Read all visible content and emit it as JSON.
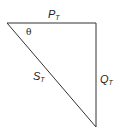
{
  "diagram": {
    "sides": {
      "top": {
        "label": "P",
        "subscript": "T"
      },
      "right": {
        "label": "Q",
        "subscript": "T"
      },
      "hypotenuse": {
        "label": "S",
        "subscript": "T"
      }
    },
    "angle": {
      "label": "θ"
    },
    "colors": {
      "stroke": "#333333",
      "text": "#222222"
    }
  }
}
